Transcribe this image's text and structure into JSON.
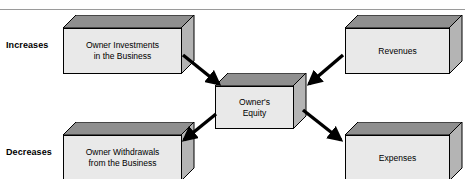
{
  "diagram": {
    "title": "Owner's Equity",
    "rule_color": "#9a9a9a",
    "colors": {
      "box_front": "#e9e9e9",
      "box_top": "#8f8f8f",
      "box_side": "#b4b4b4",
      "outline": "#000000",
      "arrow": "#000000",
      "text": "#000000"
    },
    "row_labels": [
      {
        "id": "increases",
        "label": "Increases"
      },
      {
        "id": "decreases",
        "label": "Decreases"
      }
    ],
    "nodes": [
      {
        "id": "owner-investments",
        "label": "Owner Investments\nin the Business",
        "row": "increases",
        "side": "left"
      },
      {
        "id": "revenues",
        "label": "Revenues",
        "row": "increases",
        "side": "right"
      },
      {
        "id": "owners-equity",
        "label": "Owner's\nEquity",
        "row": "center",
        "side": "center"
      },
      {
        "id": "owner-withdrawals",
        "label": "Owner Withdrawals\nfrom the Business",
        "row": "decreases",
        "side": "left"
      },
      {
        "id": "expenses",
        "label": "Expenses",
        "row": "decreases",
        "side": "right"
      }
    ],
    "edges": [
      {
        "id": "investments-to-equity",
        "from": "owner-investments",
        "to": "owners-equity",
        "direction": "to-center"
      },
      {
        "id": "revenues-to-equity",
        "from": "revenues",
        "to": "owners-equity",
        "direction": "to-center"
      },
      {
        "id": "equity-to-withdrawals",
        "from": "owners-equity",
        "to": "owner-withdrawals",
        "direction": "from-center"
      },
      {
        "id": "equity-to-expenses",
        "from": "owners-equity",
        "to": "expenses",
        "direction": "from-center"
      }
    ]
  }
}
